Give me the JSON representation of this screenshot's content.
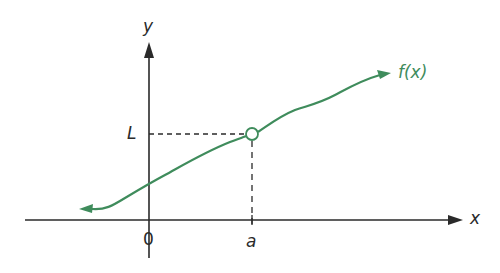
{
  "diagram": {
    "axes": {
      "x_label": "x",
      "y_label": "y",
      "origin_label": "0"
    },
    "markers": {
      "a_label": "a",
      "L_label": "L"
    },
    "curve": {
      "label": "f(x)",
      "color": "#3f8c5c",
      "open_point": {
        "x_label": "a",
        "y_label": "L",
        "style": "open-circle"
      }
    },
    "colors": {
      "axis": "#2a2a2a",
      "curve": "#3f8c5c",
      "background": "#ffffff"
    }
  }
}
